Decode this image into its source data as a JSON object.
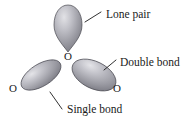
{
  "figure": {
    "background_color": "#ffffff"
  },
  "atoms": [
    {
      "id": "center-oxygen",
      "label": "O",
      "x": 68,
      "y": 57
    },
    {
      "id": "left-oxygen",
      "label": "O",
      "x": 13,
      "y": 89
    },
    {
      "id": "right-oxygen",
      "label": "O",
      "x": 117,
      "y": 89
    }
  ],
  "lobes": [
    {
      "id": "lone-pair-lobe",
      "shape": "teardrop",
      "fill_light": "#d9d9dd",
      "fill_mid": "#9a9aa2",
      "fill_dark": "#6d6d76",
      "outline_color": "#4a4a52"
    },
    {
      "id": "single-bond-lobe",
      "shape": "ellipse",
      "rotation": -32,
      "fill_light": "#dcdce0",
      "fill_mid": "#9c9ca4",
      "fill_dark": "#6f6f78",
      "outline_color": "#4a4a52"
    },
    {
      "id": "double-bond-lobe",
      "shape": "ellipse",
      "rotation": 26,
      "fill_light": "#dcdce0",
      "fill_mid": "#9c9ca4",
      "fill_dark": "#6f6f78",
      "outline_color": "#4a4a52"
    }
  ],
  "callouts": [
    {
      "id": "lone-pair",
      "label": "Lone pair",
      "text_x": 106,
      "text_y": 15
    },
    {
      "id": "double-bond",
      "label": "Double bond",
      "text_x": 120,
      "text_y": 63
    },
    {
      "id": "single-bond",
      "label": "Single bond",
      "text_x": 67,
      "text_y": 110
    }
  ]
}
